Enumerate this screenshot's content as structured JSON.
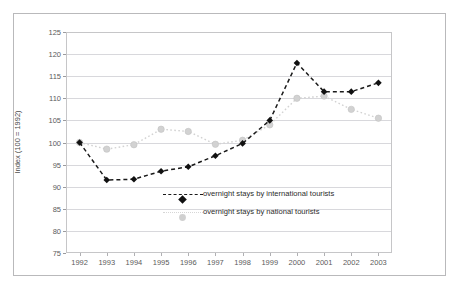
{
  "page": {
    "header_fragment_left": "",
    "header_fragment_mid": ""
  },
  "chart_data": {
    "type": "line",
    "title": "",
    "xlabel": "",
    "ylabel": "Index (100 = 1992)",
    "categories": [
      "1992",
      "1993",
      "1994",
      "1995",
      "1996",
      "1997",
      "1998",
      "1999",
      "2000",
      "2001",
      "2002",
      "2003"
    ],
    "ylim": [
      75,
      125
    ],
    "yticks": [
      75,
      80,
      85,
      90,
      95,
      100,
      105,
      110,
      115,
      120,
      125
    ],
    "grid": true,
    "legend_position": "inside-bottom-center",
    "series": [
      {
        "name": "overnight stays by international tourists",
        "marker": "diamond",
        "color": "#1a1a1a",
        "linestyle": "dashed",
        "values": [
          100.0,
          91.5,
          91.7,
          93.5,
          94.5,
          97.0,
          99.8,
          105.0,
          118.0,
          111.5,
          111.5,
          113.5
        ]
      },
      {
        "name": "overnight stays by national tourists",
        "marker": "circle",
        "color": "#d2d2d2",
        "linestyle": "dotted",
        "values": [
          100.0,
          98.5,
          99.5,
          103.0,
          102.5,
          99.6,
          100.5,
          104.0,
          110.0,
          110.5,
          107.5,
          105.5
        ]
      }
    ]
  },
  "legend": {
    "items": [
      {
        "label": "overnight stays by international tourists"
      },
      {
        "label": "overnight stays by national tourists"
      }
    ]
  }
}
